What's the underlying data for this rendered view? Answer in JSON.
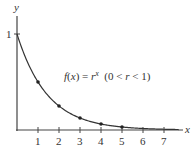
{
  "chart_data": {
    "type": "line",
    "title": "",
    "xlabel": "x",
    "ylabel": "y",
    "annotation": {
      "f": "f",
      "x1": "(",
      "xv": "x",
      "x2": ") = ",
      "r": "r",
      "exp": "x",
      "cond1": "  (0 < ",
      "cond_r": "r",
      "cond2": " < 1)"
    },
    "x_ticks": [
      "1",
      "2",
      "3",
      "4",
      "5",
      "6",
      "7"
    ],
    "y_ticks": [
      "1"
    ],
    "xlim": [
      0,
      7.8
    ],
    "ylim": [
      0,
      1
    ],
    "grid": false,
    "series": [
      {
        "name": "f(x) = r^x",
        "r": 0.5,
        "points": [
          {
            "x": 1,
            "y": 0.5
          },
          {
            "x": 2,
            "y": 0.25
          },
          {
            "x": 3,
            "y": 0.125
          },
          {
            "x": 4,
            "y": 0.0625
          },
          {
            "x": 5,
            "y": 0.03125
          }
        ],
        "curve_start": {
          "x": 0,
          "y": 1
        },
        "color": "#333333"
      }
    ]
  }
}
